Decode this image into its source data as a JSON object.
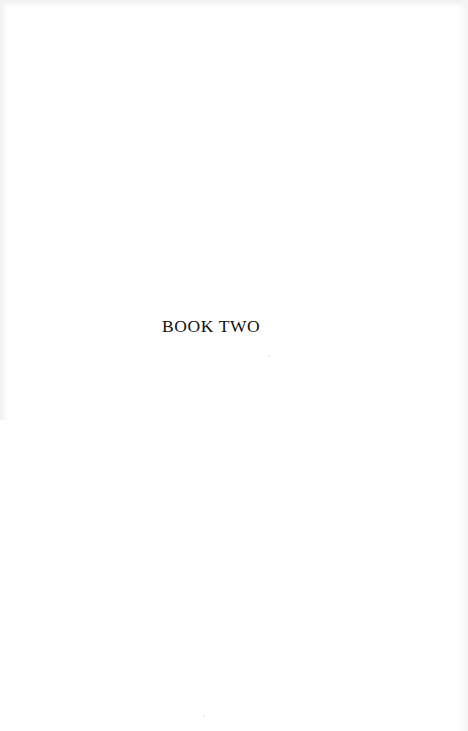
{
  "page": {
    "section_title": "BOOK TWO",
    "background_color": "#ffffff",
    "text_color": "#111111"
  }
}
